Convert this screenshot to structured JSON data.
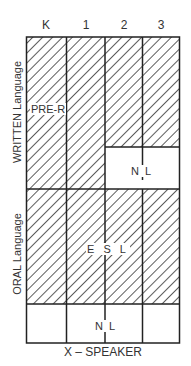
{
  "diagram": {
    "columns": [
      "K",
      "1",
      "2",
      "3"
    ],
    "row_labels": {
      "top": "WRITTEN Language",
      "bottom": "ORAL Language"
    },
    "regions": [
      {
        "id": "pre-r",
        "label": "PRE-R",
        "hatched": true
      },
      {
        "id": "nl-written",
        "label": "N  L",
        "hatched": false
      },
      {
        "id": "esl",
        "label": "E S L",
        "hatched": true
      },
      {
        "id": "nl-oral",
        "label": "N  L",
        "hatched": false
      }
    ],
    "x_axis_label": "X – SPEAKER",
    "colors": {
      "line": "#222222",
      "hatch": "#333333",
      "background": "#ffffff"
    }
  }
}
